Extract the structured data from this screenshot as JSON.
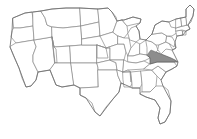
{
  "figure": {
    "kind": "choropleth-outline-map",
    "title": "",
    "subtitle": "",
    "background_color": "#ffffff",
    "width_px": 197,
    "height_px": 139
  },
  "map": {
    "name": "united-states-lower-48",
    "projection_hint": "albers-like",
    "border_color": "#8a8a8a",
    "outline_color": "#6f6f6f",
    "default_state_fill": "#ffffff",
    "highlight_fill": "#8d8d8d",
    "highlight_stroke": "#5d5d5d",
    "highlighted_states": [
      "Virginia"
    ],
    "labels_visible": false,
    "legend_visible": false,
    "states": [
      {
        "code": "WA",
        "name": "Washington",
        "highlighted": false
      },
      {
        "code": "OR",
        "name": "Oregon",
        "highlighted": false
      },
      {
        "code": "CA",
        "name": "California",
        "highlighted": false
      },
      {
        "code": "NV",
        "name": "Nevada",
        "highlighted": false
      },
      {
        "code": "ID",
        "name": "Idaho",
        "highlighted": false
      },
      {
        "code": "MT",
        "name": "Montana",
        "highlighted": false
      },
      {
        "code": "WY",
        "name": "Wyoming",
        "highlighted": false
      },
      {
        "code": "UT",
        "name": "Utah",
        "highlighted": false
      },
      {
        "code": "AZ",
        "name": "Arizona",
        "highlighted": false
      },
      {
        "code": "CO",
        "name": "Colorado",
        "highlighted": false
      },
      {
        "code": "NM",
        "name": "New Mexico",
        "highlighted": false
      },
      {
        "code": "ND",
        "name": "North Dakota",
        "highlighted": false
      },
      {
        "code": "SD",
        "name": "South Dakota",
        "highlighted": false
      },
      {
        "code": "NE",
        "name": "Nebraska",
        "highlighted": false
      },
      {
        "code": "KS",
        "name": "Kansas",
        "highlighted": false
      },
      {
        "code": "OK",
        "name": "Oklahoma",
        "highlighted": false
      },
      {
        "code": "TX",
        "name": "Texas",
        "highlighted": false
      },
      {
        "code": "MN",
        "name": "Minnesota",
        "highlighted": false
      },
      {
        "code": "IA",
        "name": "Iowa",
        "highlighted": false
      },
      {
        "code": "MO",
        "name": "Missouri",
        "highlighted": false
      },
      {
        "code": "AR",
        "name": "Arkansas",
        "highlighted": false
      },
      {
        "code": "LA",
        "name": "Louisiana",
        "highlighted": false
      },
      {
        "code": "WI",
        "name": "Wisconsin",
        "highlighted": false
      },
      {
        "code": "IL",
        "name": "Illinois",
        "highlighted": false
      },
      {
        "code": "MI",
        "name": "Michigan",
        "highlighted": false
      },
      {
        "code": "IN",
        "name": "Indiana",
        "highlighted": false
      },
      {
        "code": "OH",
        "name": "Ohio",
        "highlighted": false
      },
      {
        "code": "KY",
        "name": "Kentucky",
        "highlighted": false
      },
      {
        "code": "TN",
        "name": "Tennessee",
        "highlighted": false
      },
      {
        "code": "MS",
        "name": "Mississippi",
        "highlighted": false
      },
      {
        "code": "AL",
        "name": "Alabama",
        "highlighted": false
      },
      {
        "code": "GA",
        "name": "Georgia",
        "highlighted": false
      },
      {
        "code": "FL",
        "name": "Florida",
        "highlighted": false
      },
      {
        "code": "SC",
        "name": "South Carolina",
        "highlighted": false
      },
      {
        "code": "NC",
        "name": "North Carolina",
        "highlighted": false
      },
      {
        "code": "VA",
        "name": "Virginia",
        "highlighted": true
      },
      {
        "code": "WV",
        "name": "West Virginia",
        "highlighted": false
      },
      {
        "code": "MD",
        "name": "Maryland",
        "highlighted": false
      },
      {
        "code": "DE",
        "name": "Delaware",
        "highlighted": false
      },
      {
        "code": "PA",
        "name": "Pennsylvania",
        "highlighted": false
      },
      {
        "code": "NJ",
        "name": "New Jersey",
        "highlighted": false
      },
      {
        "code": "NY",
        "name": "New York",
        "highlighted": false
      },
      {
        "code": "CT",
        "name": "Connecticut",
        "highlighted": false
      },
      {
        "code": "RI",
        "name": "Rhode Island",
        "highlighted": false
      },
      {
        "code": "MA",
        "name": "Massachusetts",
        "highlighted": false
      },
      {
        "code": "VT",
        "name": "Vermont",
        "highlighted": false
      },
      {
        "code": "NH",
        "name": "New Hampshire",
        "highlighted": false
      },
      {
        "code": "ME",
        "name": "Maine",
        "highlighted": false
      }
    ]
  }
}
